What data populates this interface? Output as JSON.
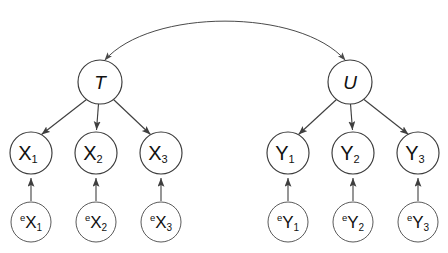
{
  "diagram": {
    "title": "",
    "type": "path-diagram",
    "background_color": "#ffffff",
    "stroke_color": "#3f3f3f",
    "text_color": "#111111",
    "latent_nodes": [
      {
        "id": "T",
        "label": "T",
        "cx": 100,
        "cy": 82,
        "r": 22
      },
      {
        "id": "U",
        "label": "U",
        "cx": 350,
        "cy": 82,
        "r": 22
      }
    ],
    "indicator_nodes": [
      {
        "id": "X1",
        "base": "X",
        "subscript": "1",
        "cx": 31,
        "cy": 153,
        "r": 21
      },
      {
        "id": "X2",
        "base": "X",
        "subscript": "2",
        "cx": 96,
        "cy": 153,
        "r": 21
      },
      {
        "id": "X3",
        "base": "X",
        "subscript": "3",
        "cx": 161,
        "cy": 153,
        "r": 21
      },
      {
        "id": "Y1",
        "base": "Y",
        "subscript": "1",
        "cx": 288,
        "cy": 153,
        "r": 21
      },
      {
        "id": "Y2",
        "base": "Y",
        "subscript": "2",
        "cx": 353,
        "cy": 153,
        "r": 21
      },
      {
        "id": "Y3",
        "base": "Y",
        "subscript": "3",
        "cx": 418,
        "cy": 153,
        "r": 21
      }
    ],
    "error_nodes": [
      {
        "id": "eX1",
        "superscript": "e",
        "base": "X",
        "subscript": "1",
        "cx": 31,
        "cy": 222,
        "r": 20
      },
      {
        "id": "eX2",
        "superscript": "e",
        "base": "X",
        "subscript": "2",
        "cx": 96,
        "cy": 222,
        "r": 20
      },
      {
        "id": "eX3",
        "superscript": "e",
        "base": "X",
        "subscript": "3",
        "cx": 161,
        "cy": 222,
        "r": 20
      },
      {
        "id": "eY1",
        "superscript": "e",
        "base": "Y",
        "subscript": "1",
        "cx": 288,
        "cy": 222,
        "r": 20
      },
      {
        "id": "eY2",
        "superscript": "e",
        "base": "Y",
        "subscript": "2",
        "cx": 353,
        "cy": 222,
        "r": 20
      },
      {
        "id": "eY3",
        "superscript": "e",
        "base": "Y",
        "subscript": "3",
        "cx": 418,
        "cy": 222,
        "r": 20
      }
    ],
    "edges": [
      {
        "id": "T-X1",
        "from": "T",
        "to": "X1",
        "style": "straight",
        "arrow": "single"
      },
      {
        "id": "T-X2",
        "from": "T",
        "to": "X2",
        "style": "straight",
        "arrow": "single"
      },
      {
        "id": "T-X3",
        "from": "T",
        "to": "X3",
        "style": "straight",
        "arrow": "single"
      },
      {
        "id": "U-Y1",
        "from": "U",
        "to": "Y1",
        "style": "straight",
        "arrow": "single"
      },
      {
        "id": "U-Y2",
        "from": "U",
        "to": "Y2",
        "style": "straight",
        "arrow": "single"
      },
      {
        "id": "U-Y3",
        "from": "U",
        "to": "Y3",
        "style": "straight",
        "arrow": "single"
      },
      {
        "id": "eX1-X1",
        "from": "eX1",
        "to": "X1",
        "style": "straight",
        "arrow": "single"
      },
      {
        "id": "eX2-X2",
        "from": "eX2",
        "to": "X2",
        "style": "straight",
        "arrow": "single"
      },
      {
        "id": "eX3-X3",
        "from": "eX3",
        "to": "X3",
        "style": "straight",
        "arrow": "single"
      },
      {
        "id": "eY1-Y1",
        "from": "eY1",
        "to": "Y1",
        "style": "straight",
        "arrow": "single"
      },
      {
        "id": "eY2-Y2",
        "from": "eY2",
        "to": "Y2",
        "style": "straight",
        "arrow": "single"
      },
      {
        "id": "eY3-Y3",
        "from": "eY3",
        "to": "Y3",
        "style": "straight",
        "arrow": "single"
      },
      {
        "id": "T-U",
        "from": "T",
        "to": "U",
        "style": "curved",
        "arrow": "double"
      }
    ]
  }
}
